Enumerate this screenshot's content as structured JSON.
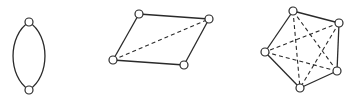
{
  "diagram": {
    "colors": {
      "stroke": "#2a2a2a",
      "vertex_fill": "#ffffff",
      "background": "#ffffff"
    },
    "graphs": [
      {
        "id": "digon",
        "vertex_count": 2,
        "vertices": [
          "top",
          "bottom"
        ],
        "edges": [
          {
            "from": "top",
            "to": "bottom",
            "style": "solid",
            "curve": "left"
          },
          {
            "from": "top",
            "to": "bottom",
            "style": "solid",
            "curve": "right"
          }
        ]
      },
      {
        "id": "quadrilateral",
        "vertex_count": 4,
        "vertices": [
          "top-left",
          "top-right",
          "bottom-right",
          "bottom-left"
        ],
        "edges": [
          {
            "from": "top-left",
            "to": "top-right",
            "style": "solid"
          },
          {
            "from": "top-right",
            "to": "bottom-right",
            "style": "solid"
          },
          {
            "from": "bottom-right",
            "to": "bottom-left",
            "style": "solid"
          },
          {
            "from": "bottom-left",
            "to": "top-left",
            "style": "solid"
          },
          {
            "from": "bottom-left",
            "to": "top-right",
            "style": "dashed"
          }
        ]
      },
      {
        "id": "pentagon",
        "vertex_count": 5,
        "vertices": [
          "top",
          "upper-right",
          "lower-right",
          "bottom",
          "left"
        ],
        "edges": [
          {
            "from": "top",
            "to": "upper-right",
            "style": "solid"
          },
          {
            "from": "upper-right",
            "to": "lower-right",
            "style": "solid"
          },
          {
            "from": "lower-right",
            "to": "bottom",
            "style": "solid"
          },
          {
            "from": "bottom",
            "to": "left",
            "style": "solid"
          },
          {
            "from": "left",
            "to": "top",
            "style": "solid"
          },
          {
            "from": "top",
            "to": "lower-right",
            "style": "dashed"
          },
          {
            "from": "top",
            "to": "bottom",
            "style": "dashed"
          },
          {
            "from": "upper-right",
            "to": "bottom",
            "style": "dashed"
          },
          {
            "from": "upper-right",
            "to": "left",
            "style": "dashed"
          },
          {
            "from": "lower-right",
            "to": "left",
            "style": "dashed"
          }
        ]
      }
    ]
  }
}
